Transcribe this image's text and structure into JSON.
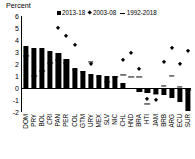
{
  "chart_data": {
    "type": "bar",
    "title": "",
    "ylabel": "Percent",
    "xlabel": "",
    "ylim": [
      -2,
      6
    ],
    "yticks": [
      6,
      5,
      4,
      3,
      2,
      1,
      0,
      -1,
      -2
    ],
    "grid": false,
    "legend_position": "top",
    "legend": [
      {
        "symbol": "square",
        "label": "2013-18"
      },
      {
        "symbol": "diamond",
        "label": "2003-08"
      },
      {
        "symbol": "dash",
        "label": "1992-2018"
      }
    ],
    "categories": [
      "DOM",
      "PRY",
      "BOL",
      "CRI",
      "PAN",
      "PER",
      "COL",
      "GTM",
      "URY",
      "MEX",
      "SLV",
      "NIC",
      "CHL",
      "HND",
      "BRA",
      "HTI",
      "JAM",
      "BRB",
      "ARG",
      "ECU",
      "SUR"
    ],
    "series": [
      {
        "name": "2013-18",
        "symbol": "square",
        "render": "bar",
        "values": [
          3.5,
          3.3,
          3.3,
          3.1,
          2.9,
          2.4,
          1.7,
          1.4,
          1.2,
          1.1,
          1.0,
          1.0,
          0.4,
          -0.1,
          -0.3,
          -0.4,
          -0.5,
          -0.6,
          -0.8,
          -1.2,
          -1.9
        ]
      },
      {
        "name": "2003-08",
        "symbol": "diamond",
        "render": "marker",
        "values": [
          null,
          null,
          null,
          null,
          5.0,
          4.3,
          3.6,
          null,
          2.0,
          null,
          null,
          null,
          2.3,
          2.9,
          1.6,
          -0.9,
          -1.0,
          2.2,
          3.3,
          2.0,
          3.1
        ]
      },
      {
        "name": "1992-2018",
        "symbol": "dash",
        "render": "marker",
        "values": [
          2.7,
          1.0,
          1.4,
          2.1,
          2.3,
          2.1,
          1.5,
          1.3,
          2.2,
          0.9,
          0.5,
          0.9,
          1.1,
          0.9,
          0.9,
          -1.3,
          -0.5,
          0.2,
          1.0,
          0.1,
          -0.2
        ]
      }
    ]
  }
}
